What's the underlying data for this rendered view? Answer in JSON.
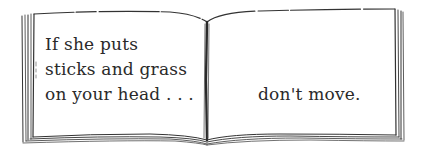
{
  "book": {
    "left_page": {
      "lines": [
        "If she puts",
        "sticks and grass",
        "on your head . . ."
      ]
    },
    "right_page": {
      "text": "don't move."
    }
  },
  "colors": {
    "ink": "#2a2a2a",
    "paper": "#ffffff"
  }
}
